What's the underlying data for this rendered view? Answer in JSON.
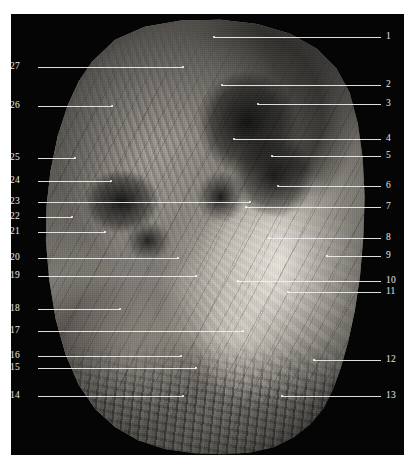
{
  "plate": {
    "title": "Anatomical dissection photograph with numbered leader labels",
    "background_color": "#ffffff",
    "board_color": "#050505",
    "leader_color": "#efefef",
    "label_color": "#e9e9e9"
  },
  "labels_left": [
    {
      "num": "27",
      "y": 67,
      "text_x": 20,
      "line_start": 38,
      "line_end": 183,
      "dot": true
    },
    {
      "num": "26",
      "y": 106,
      "text_x": 20,
      "line_start": 38,
      "line_end": 112,
      "dot": true
    },
    {
      "num": "25",
      "y": 158,
      "text_x": 20,
      "line_start": 38,
      "line_end": 75,
      "dot": true
    },
    {
      "num": "24",
      "y": 181,
      "text_x": 20,
      "line_start": 38,
      "line_end": 111,
      "dot": true
    },
    {
      "num": "23",
      "y": 202,
      "text_x": 20,
      "line_start": 38,
      "line_end": 250,
      "dot": true
    },
    {
      "num": "22",
      "y": 217,
      "text_x": 20,
      "line_start": 38,
      "line_end": 72,
      "dot": true
    },
    {
      "num": "21",
      "y": 232,
      "text_x": 20,
      "line_start": 38,
      "line_end": 105,
      "dot": true
    },
    {
      "num": "20",
      "y": 258,
      "text_x": 20,
      "line_start": 38,
      "line_end": 178,
      "dot": true
    },
    {
      "num": "19",
      "y": 276,
      "text_x": 20,
      "line_start": 38,
      "line_end": 196,
      "dot": true
    },
    {
      "num": "18",
      "y": 309,
      "text_x": 20,
      "line_start": 38,
      "line_end": 120,
      "dot": true
    },
    {
      "num": "17",
      "y": 331,
      "text_x": 20,
      "line_start": 38,
      "line_end": 243,
      "dot": true
    },
    {
      "num": "16",
      "y": 356,
      "text_x": 20,
      "line_start": 38,
      "line_end": 181,
      "dot": true
    },
    {
      "num": "15",
      "y": 368,
      "text_x": 20,
      "line_start": 38,
      "line_end": 196,
      "dot": true
    },
    {
      "num": "14",
      "y": 396,
      "text_x": 20,
      "line_start": 38,
      "line_end": 183,
      "dot": true
    }
  ],
  "labels_right": [
    {
      "num": "1",
      "y": 37,
      "text_x": 386,
      "line_start": 214,
      "line_end": 381,
      "dot": true
    },
    {
      "num": "2",
      "y": 85,
      "text_x": 386,
      "line_start": 222,
      "line_end": 381,
      "dot": true
    },
    {
      "num": "3",
      "y": 104,
      "text_x": 386,
      "line_start": 258,
      "line_end": 381,
      "dot": true
    },
    {
      "num": "4",
      "y": 139,
      "text_x": 386,
      "line_start": 234,
      "line_end": 381,
      "dot": true
    },
    {
      "num": "5",
      "y": 156,
      "text_x": 386,
      "line_start": 272,
      "line_end": 381,
      "dot": true
    },
    {
      "num": "6",
      "y": 186,
      "text_x": 386,
      "line_start": 278,
      "line_end": 381,
      "dot": true
    },
    {
      "num": "7",
      "y": 207,
      "text_x": 386,
      "line_start": 246,
      "line_end": 381,
      "dot": true
    },
    {
      "num": "8",
      "y": 238,
      "text_x": 386,
      "line_start": 269,
      "line_end": 381,
      "dot": true
    },
    {
      "num": "9",
      "y": 256,
      "text_x": 386,
      "line_start": 327,
      "line_end": 381,
      "dot": true
    },
    {
      "num": "10",
      "y": 281,
      "text_x": 386,
      "line_start": 238,
      "line_end": 381,
      "dot": true
    },
    {
      "num": "11",
      "y": 292,
      "text_x": 386,
      "line_start": 288,
      "line_end": 381,
      "dot": true
    },
    {
      "num": "12",
      "y": 360,
      "text_x": 386,
      "line_start": 314,
      "line_end": 381,
      "dot": true
    },
    {
      "num": "13",
      "y": 396,
      "text_x": 386,
      "line_start": 282,
      "line_end": 381,
      "dot": true
    }
  ]
}
